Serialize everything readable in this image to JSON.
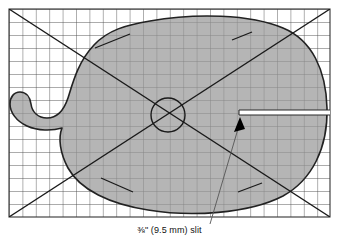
{
  "figure": {
    "name": "template-grid-diagram",
    "caption": "⅜\" (9.5 mm) slit",
    "caption_fraction": "3/8",
    "caption_inches": "3/8 in",
    "caption_metric": "9.5 mm",
    "caption_feature": "slit"
  },
  "colors": {
    "background": "#ffffff",
    "shape_fill": "#999999",
    "shape_outline": "#222222",
    "grid_line": "#4a4a4a",
    "grid_border": "#333333",
    "diagonal_line": "#1a1a1a",
    "circle_line": "#1a1a1a",
    "slit_fill": "#ffffff",
    "leader_line": "#555555",
    "arrow_fill": "#000000",
    "caption_color": "#111111"
  },
  "grid": {
    "label": "measurement-grid",
    "left": 9,
    "top": 9,
    "right": 330,
    "bottom": 217,
    "cell_size": 13.4,
    "columns": 24,
    "rows": 16
  },
  "shape": {
    "label": "pattern-outline",
    "description": "rounded blob with left notch and tail"
  },
  "center_circle": {
    "label": "center-circle",
    "cx": 168,
    "cy": 115,
    "r": 17
  },
  "diagonals": [
    {
      "name": "diagonal-tl-br",
      "x1": 9,
      "y1": 9,
      "x2": 330,
      "y2": 217
    },
    {
      "name": "diagonal-bl-tr",
      "x1": 9,
      "y1": 217,
      "x2": 330,
      "y2": 9
    }
  ],
  "tick_marks": [
    {
      "name": "tick-upper-left",
      "x1": 95,
      "y1": 48,
      "x2": 130,
      "y2": 34
    },
    {
      "name": "tick-upper-right",
      "x1": 232,
      "y1": 40,
      "x2": 252,
      "y2": 32
    },
    {
      "name": "tick-lower-left",
      "x1": 101,
      "y1": 178,
      "x2": 133,
      "y2": 192
    },
    {
      "name": "tick-lower-right",
      "x1": 238,
      "y1": 192,
      "x2": 262,
      "y2": 183
    }
  ],
  "slit": {
    "label": "slit-opening",
    "x": 239,
    "y": 110,
    "width": 91,
    "height": 5
  },
  "leader": {
    "label": "slit-leader-line",
    "x1": 210,
    "y1": 224,
    "x2": 240,
    "y2": 120,
    "arrow_tip_x": 240,
    "arrow_tip_y": 118
  }
}
